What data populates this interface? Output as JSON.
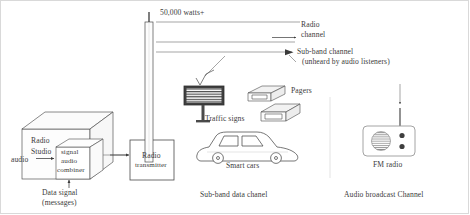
{
  "diagram": {
    "title_caption_left": "Data signal\n(messages)",
    "power_label": "50,000 watts+",
    "studio": {
      "name_line1": "Radio",
      "name_line2": "Studio",
      "audio_input_label": "audio",
      "combiner_line1": "signal",
      "combiner_line2": "audio",
      "combiner_line3": "combiner",
      "caption_line1": "Data signal",
      "caption_line2": "(messages)"
    },
    "transmitter": {
      "line1": "Radio",
      "line2": "transmitter"
    },
    "channels": {
      "radio_channel_line1": "Radio",
      "radio_channel_line2": "channel",
      "subband_line1": "Sub-band channel",
      "subband_line2": "(unheard by audio listeners)"
    },
    "receivers": {
      "traffic_sign_label": "Traffic signs",
      "traffic_sign_text": "Bad Road",
      "pagers_label": "Pagers",
      "smart_cars_label": "Smart cars",
      "fm_radio_label": "FM radio"
    },
    "captions": {
      "subband_data": "Sub-band data chanel",
      "audio_broadcast": "Audio broadcast Channel"
    },
    "colors": {
      "ink": "#3a3a3a",
      "line": "#4a4a4a",
      "fill_light": "#fbfbfb",
      "divider": "#e6e6e6",
      "frame": "#d9d9d9",
      "sign_dark": "#3d3d3d"
    }
  }
}
